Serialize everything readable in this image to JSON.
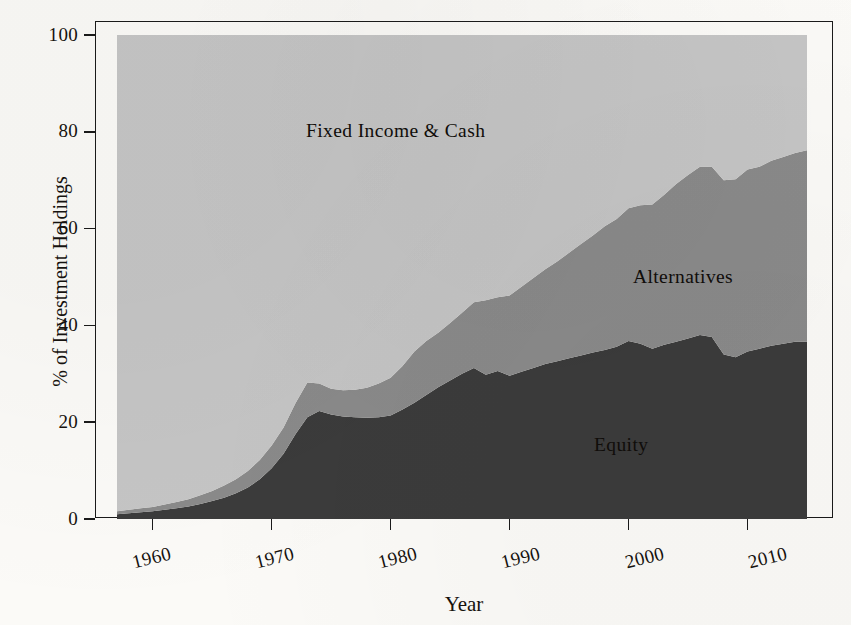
{
  "figure": {
    "background_color": "#fbfaf7",
    "frame_color": "#1a1a1a"
  },
  "axes": {
    "x_label": "Year",
    "y_label": "% of Investment Holdings",
    "x_ticks": [
      "1960",
      "1970",
      "1980",
      "1990",
      "2000",
      "2010"
    ],
    "y_ticks": [
      "0",
      "20",
      "40",
      "60",
      "80",
      "100"
    ]
  },
  "annotations": {
    "fixed_income": "Fixed Income & Cash",
    "alternatives": "Alternatives",
    "equity": "Equity"
  },
  "chart_data": {
    "type": "area",
    "stacked": true,
    "title": "",
    "xlabel": "Year",
    "ylabel": "% of Investment Holdings",
    "xlim": [
      1957,
      2015
    ],
    "ylim": [
      0,
      100
    ],
    "grid": false,
    "legend": "inline-area-labels",
    "colors": {
      "Equity": "#3a3a3a",
      "Alternatives": "#8a8a8a",
      "Fixed Income & Cash": "#c5c5c5"
    },
    "x": [
      1957,
      1958,
      1959,
      1960,
      1961,
      1962,
      1963,
      1964,
      1965,
      1966,
      1967,
      1968,
      1969,
      1970,
      1971,
      1972,
      1973,
      1974,
      1975,
      1976,
      1977,
      1978,
      1979,
      1980,
      1981,
      1982,
      1983,
      1984,
      1985,
      1986,
      1987,
      1988,
      1989,
      1990,
      1991,
      1992,
      1993,
      1994,
      1995,
      1996,
      1997,
      1998,
      1999,
      2000,
      2001,
      2002,
      2003,
      2004,
      2005,
      2006,
      2007,
      2008,
      2009,
      2010,
      2011,
      2012,
      2013,
      2014,
      2015
    ],
    "series": [
      {
        "name": "Equity",
        "values": [
          1.0,
          1.2,
          1.4,
          1.6,
          1.9,
          2.2,
          2.6,
          3.1,
          3.7,
          4.4,
          5.3,
          6.5,
          8.2,
          10.5,
          13.5,
          17.5,
          21.0,
          22.3,
          21.6,
          21.2,
          21.0,
          20.9,
          21.0,
          21.4,
          22.6,
          24.0,
          25.6,
          27.2,
          28.6,
          30.0,
          31.2,
          29.8,
          30.6,
          29.6,
          30.4,
          31.2,
          32.0,
          32.6,
          33.2,
          33.8,
          34.4,
          34.9,
          35.6,
          36.8,
          36.2,
          35.2,
          36.0,
          36.6,
          37.3,
          38.0,
          37.6,
          34.0,
          33.4,
          34.6,
          35.2,
          35.8,
          36.2,
          36.6,
          36.6
        ]
      },
      {
        "name": "Alternatives",
        "values": [
          0.6,
          0.7,
          0.8,
          0.9,
          1.1,
          1.3,
          1.5,
          1.8,
          2.1,
          2.5,
          2.9,
          3.4,
          4.0,
          4.7,
          5.4,
          6.4,
          7.2,
          5.7,
          5.3,
          5.4,
          5.7,
          6.2,
          7.0,
          7.8,
          9.0,
          10.6,
          11.2,
          11.3,
          11.9,
          12.6,
          13.6,
          15.4,
          15.2,
          16.6,
          17.6,
          18.6,
          19.6,
          20.6,
          21.8,
          23.0,
          24.2,
          25.6,
          26.4,
          27.4,
          28.6,
          29.8,
          31.0,
          32.6,
          33.8,
          34.8,
          35.2,
          36.0,
          36.8,
          37.6,
          37.6,
          38.2,
          38.6,
          39.0,
          39.6
        ]
      },
      {
        "name": "Fixed Income & Cash",
        "values": [
          98.4,
          98.1,
          97.8,
          97.5,
          97.0,
          96.5,
          95.9,
          95.1,
          94.2,
          93.1,
          91.8,
          90.1,
          87.8,
          84.8,
          81.1,
          76.1,
          71.8,
          72.0,
          73.1,
          73.4,
          73.3,
          72.9,
          72.0,
          70.8,
          68.4,
          65.4,
          63.2,
          61.5,
          59.5,
          57.4,
          55.2,
          54.8,
          54.2,
          53.8,
          52.0,
          50.2,
          48.4,
          46.8,
          45.0,
          43.2,
          41.4,
          39.5,
          38.0,
          35.8,
          35.2,
          35.0,
          33.0,
          30.8,
          28.9,
          27.2,
          27.2,
          30.0,
          29.8,
          27.8,
          27.2,
          26.0,
          25.2,
          24.4,
          23.8
        ]
      }
    ]
  }
}
